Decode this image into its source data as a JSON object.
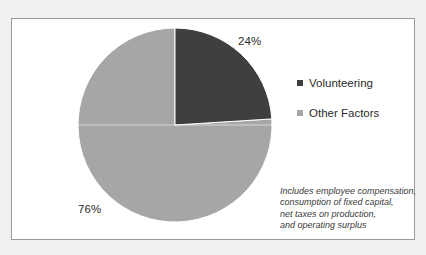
{
  "chart_data": {
    "type": "pie",
    "title": "",
    "labels": [
      "Volunteering",
      "Other Factors"
    ],
    "values": [
      24,
      76
    ],
    "data_labels": [
      "24%",
      "76%"
    ],
    "unit": "percent",
    "start_angle_deg": 0,
    "direction": "clockwise",
    "colors": [
      "#3f3f3f",
      "#a6a6a6"
    ],
    "legend": {
      "position": "right",
      "entries": [
        {
          "label": "Volunteering",
          "color": "#3f3f3f"
        },
        {
          "label": "Other Factors",
          "color": "#a6a6a6"
        }
      ]
    },
    "annotation": {
      "style": "italic",
      "lines": [
        "Includes employee compensation,",
        "consumption of fixed capital,",
        "net taxes on production,",
        "and operating surplus"
      ]
    },
    "grid": false,
    "xlabel": "",
    "ylabel": ""
  },
  "frame": {
    "border_color": "#9a9a9a",
    "background": "#ffffff"
  },
  "page": {
    "background": "#f2f1ef"
  }
}
